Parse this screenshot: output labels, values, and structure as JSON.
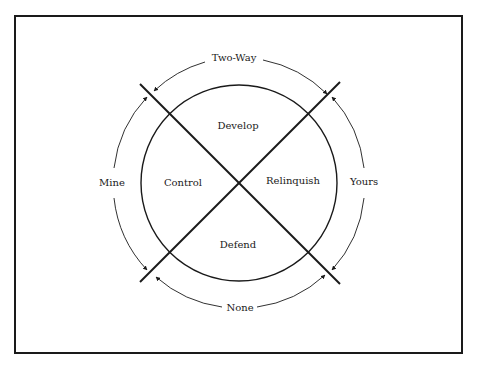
{
  "diagram": {
    "frame": {
      "x": 15,
      "y": 16,
      "width": 447,
      "height": 337,
      "stroke": "#1a1a1a"
    },
    "center": {
      "x": 239,
      "y": 183
    },
    "inner_circle_radius": 98,
    "outer_circle_radius": 125,
    "colors": {
      "ink": "#1a1a1a",
      "background": "#ffffff"
    },
    "quadrant_labels": {
      "top": "Develop",
      "left": "Control",
      "right": "Relinquish",
      "bottom": "Defend"
    },
    "outer_labels": {
      "top": "Two-Way",
      "left": "Mine",
      "right": "Yours",
      "bottom": "None"
    },
    "axes": [
      {
        "name": "diagonal-top-left-to-bottom-right",
        "x1": 140,
        "y1": 84,
        "x2": 340,
        "y2": 284
      },
      {
        "name": "diagonal-bottom-left-to-top-right",
        "x1": 140,
        "y1": 282,
        "x2": 340,
        "y2": 82
      }
    ]
  }
}
